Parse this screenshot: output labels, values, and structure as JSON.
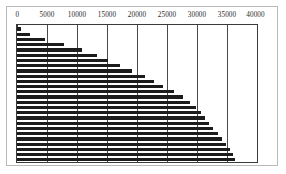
{
  "chart_data": {
    "type": "bar",
    "orientation": "horizontal",
    "title": "",
    "subtitle": "",
    "xlabel": "",
    "ylabel": "",
    "xlim": [
      0,
      40000
    ],
    "ylim": null,
    "grid": true,
    "grid_axis": "x",
    "legend": false,
    "legend_position": "none",
    "axis_position": "top",
    "bar_color": "#1c1c1c",
    "frame_color": "#3a3a3a",
    "background_color": "#ffffff",
    "xticks": [
      0,
      5000,
      10000,
      15000,
      20000,
      25000,
      30000,
      35000,
      40000
    ],
    "xtick_labels": [
      "0",
      "5000",
      "10000",
      "15000",
      "20000",
      "25000",
      "30000",
      "35000",
      "40000"
    ],
    "categories": [
      "1",
      "2",
      "3",
      "4",
      "5",
      "6",
      "7",
      "8",
      "9",
      "10",
      "11",
      "12",
      "13",
      "14",
      "15",
      "16",
      "17",
      "18",
      "19",
      "20",
      "21",
      "22",
      "23",
      "24",
      "25",
      "26"
    ],
    "ytick_labels": [],
    "values": [
      700,
      2200,
      4700,
      7800,
      10900,
      13400,
      15100,
      17200,
      19100,
      21300,
      22900,
      24400,
      26100,
      27600,
      28900,
      29800,
      30600,
      31300,
      32000,
      32700,
      33500,
      34200,
      34900,
      35500,
      36000,
      36400
    ],
    "series": [
      {
        "name": "",
        "values": [
          700,
          2200,
          4700,
          7800,
          10900,
          13400,
          15100,
          17200,
          19100,
          21300,
          22900,
          24400,
          26100,
          27600,
          28900,
          29800,
          30600,
          31300,
          32000,
          32700,
          33500,
          34200,
          34900,
          35500,
          36000,
          36400
        ]
      }
    ],
    "annotations": [],
    "bar_count": 26,
    "sort_order": "ascending"
  }
}
